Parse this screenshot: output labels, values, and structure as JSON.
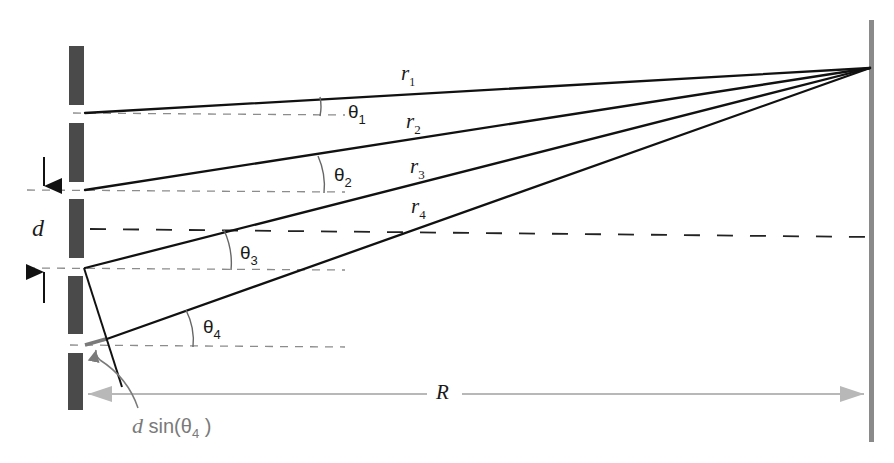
{
  "diagram": {
    "labels": {
      "r1": {
        "base": "r",
        "sub": "1"
      },
      "r2": {
        "base": "r",
        "sub": "2"
      },
      "r3": {
        "base": "r",
        "sub": "3"
      },
      "r4": {
        "base": "r",
        "sub": "4"
      },
      "theta1": {
        "base": "θ",
        "sub": "1"
      },
      "theta2": {
        "base": "θ",
        "sub": "2"
      },
      "theta3": {
        "base": "θ",
        "sub": "3"
      },
      "theta4": {
        "base": "θ",
        "sub": "4"
      },
      "d": "d",
      "R": "R",
      "path_diff": {
        "prefix": "d",
        "func": " sin(",
        "theta": "θ",
        "sub": "4",
        "close": " )"
      }
    },
    "slits": [
      {
        "id": "slit-1",
        "y": 113
      },
      {
        "id": "slit-2",
        "y": 190
      },
      {
        "id": "slit-3",
        "y": 268
      },
      {
        "id": "slit-4",
        "y": 345
      }
    ],
    "screen_point": {
      "x": 870,
      "y": 68
    },
    "colors": {
      "barrier": "#4a4a4a",
      "rays": "#111111",
      "guides": "#8c8c8c",
      "screen": "#8a8a8a",
      "annotation": "#7a7a7a",
      "distance_arrow": "#b8b8b8"
    }
  }
}
